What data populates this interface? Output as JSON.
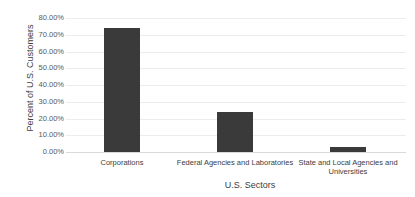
{
  "chart_data": {
    "type": "bar",
    "title": "",
    "xlabel": "U.S. Sectors",
    "ylabel": "Percent of U.S. Customers",
    "categories": [
      "Corporations",
      "Federal Agencies and Laboratories",
      "State and Local Agencies and Universities"
    ],
    "values": [
      74,
      24,
      3
    ],
    "value_unit": "%",
    "ylim": [
      0,
      80
    ],
    "yticks": [
      "0.00%",
      "10.00%",
      "20.00%",
      "30.00%",
      "40.00%",
      "50.00%",
      "60.00%",
      "70.00%",
      "80.00%"
    ],
    "grid": true,
    "legend": null,
    "bar_color": "#3a3a3a"
  }
}
